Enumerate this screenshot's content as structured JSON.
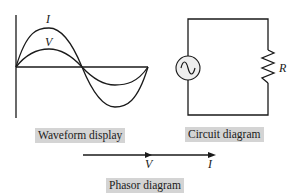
{
  "waveform": {
    "caption": "Waveform display",
    "current_label": "I",
    "voltage_label": "V"
  },
  "circuit": {
    "caption": "Circuit diagram",
    "resistor_label": "R",
    "source_icon": "ac-source-icon"
  },
  "phasor": {
    "caption": "Phasor diagram",
    "voltage_label": "V",
    "current_label": "I"
  },
  "colors": {
    "stroke": "#1a1a1a",
    "caption_bg": "#d4d4d4",
    "source_fill": "#eeeeee"
  }
}
